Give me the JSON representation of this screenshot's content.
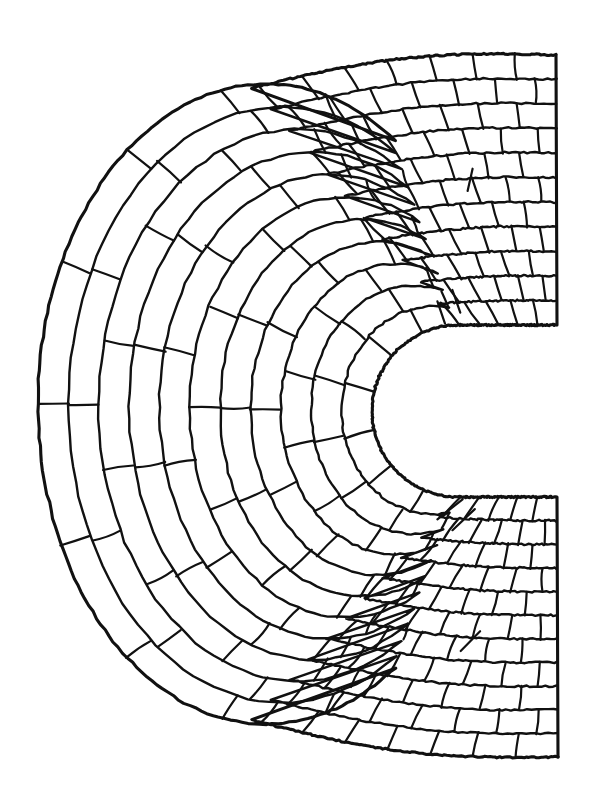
{
  "figure": {
    "title": "Horseshoe-shaped paved stone structure plan",
    "medium": "ink line drawing",
    "background_color": "#ffffff",
    "line_color": "#111111",
    "canvas": {
      "width": 596,
      "height": 809
    }
  },
  "geometry": {
    "shape_name": "horseshoe-plan-masonry",
    "outer_outline": {
      "top_right_corner": {
        "x": 556,
        "y": 55
      },
      "bottom_right_corner": {
        "x": 558,
        "y": 757
      },
      "left_apex": {
        "x": 38,
        "y": 404
      },
      "top_edge_note": "gentle concave sweep from left apex up to top-right corner",
      "bottom_edge_note": "gentle concave sweep from left apex down to bottom-right corner",
      "left_edge_note": "large semicircular arc bulging to the left"
    },
    "inner_notch": {
      "shape": "rounded U opening to the right",
      "apex": {
        "x": 372,
        "y": 410
      },
      "top_arm_y": 325,
      "bottom_arm_y": 497,
      "opens_at_x": 556,
      "corner_radius": 86
    },
    "rings": {
      "count": 11,
      "description": "concentric courses of stones running parallel to the outer edge",
      "stone_rows_radial": 24
    }
  },
  "rendering": {
    "outline_stroke_width": 3.1,
    "ring_stroke_width": 2.4,
    "joint_stroke_width": 2.2,
    "stroke_jitter": 1.6,
    "random_seed": 20240617
  },
  "chart_data": {
    "type": "table",
    "categories": [
      "course 1",
      "course 2",
      "course 3",
      "course 4",
      "course 5",
      "course 6",
      "course 7",
      "course 8",
      "course 9",
      "course 10",
      "course 11"
    ],
    "values": [
      0.0,
      0.092,
      0.184,
      0.276,
      0.368,
      0.46,
      0.552,
      0.644,
      0.736,
      0.828,
      0.92
    ],
    "xlabel": "course index (outer → inner)",
    "ylabel": "normalised depth",
    "ylim": [
      0,
      1
    ]
  }
}
